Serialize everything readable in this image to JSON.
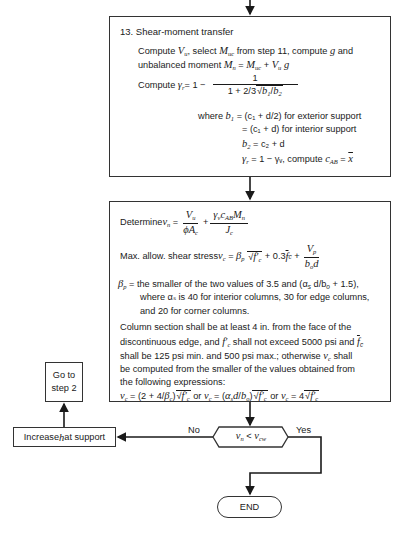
{
  "flowchart": {
    "step13": {
      "title": "13.  Shear-moment transfer",
      "line1a": "Compute ",
      "line1b": ", select ",
      "line1c": " from step 11, compute ",
      "line1d": " and",
      "line2a": "unbalanced moment ",
      "line3a": "Compute ",
      "line3b": " = 1 −",
      "frac_num": "1",
      "frac_den_a": "1 + 2/3",
      "where_b1": "where ",
      "b1_ext": " = (c₁ + d/2) for exterior support",
      "b1_int": "= (c₁ + d) for interior support",
      "b2": " = c₂ + d",
      "gamma_line": " = 1 − γᵥ, compute "
    },
    "step_check": {
      "determine": "Determine ",
      "max_allow": "Max. allow. shear stress ",
      "beta_line1": " = the smaller of the two values of 3.5 and (α",
      "beta_line1b": " d/b",
      "beta_line1c": " + 1.5),",
      "beta_line2": "where αₛ is 40 for interior columns, 30 for edge columns,",
      "beta_line3": "and 20 for corner columns.",
      "col_line1": "Column section shall be at least 4 in. from the face of the",
      "col_line2a": "discontinuous edge, and ",
      "col_line2b": " shall not exceed 5000 psi and ",
      "col_line3a": "shall be 125 psi min. and 500 psi max.; otherwise ",
      "col_line3b": " shall",
      "col_line4": "be computed from the smaller of the values obtained from",
      "col_line5": "the following expressions:",
      "expr_or": " or "
    },
    "decision": {
      "condition": "vn < vcw",
      "no_label": "No",
      "yes_label": "Yes"
    },
    "increase_box": {
      "label_a": "Increase ",
      "label_h": "h",
      "label_b": " at support"
    },
    "goto_box": {
      "line1": "Go to",
      "line2": "step 2"
    },
    "end": {
      "label": "END"
    }
  }
}
